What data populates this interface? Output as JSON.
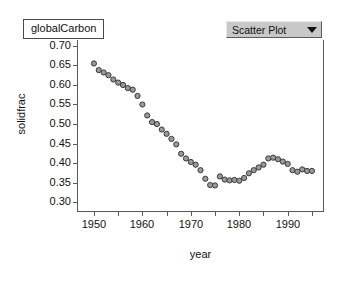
{
  "title": {
    "text": "globalCarbon"
  },
  "plot_type_selector": {
    "value": "Scatter Plot",
    "caret_icon": "chevron-down-icon"
  },
  "colors": {
    "marker_fill": "#9a9a9a",
    "marker_stroke": "#3a3a3a",
    "axis": "#5a5a5a",
    "text": "#111111",
    "dropdown_face": "#c8c8c8",
    "background": "#ffffff"
  },
  "chart_data": {
    "type": "scatter",
    "title": "globalCarbon",
    "xlabel": "year",
    "ylabel": "solidfrac",
    "xlim": [
      1946.5,
      1997.5
    ],
    "ylim": [
      0.275,
      0.715
    ],
    "grid": false,
    "legend": null,
    "xticks": [
      1950,
      1960,
      1970,
      1980,
      1990
    ],
    "xticks_minor": [
      1955,
      1965,
      1975,
      1985,
      1995
    ],
    "yticks": [
      0.3,
      0.35,
      0.4,
      0.45,
      0.5,
      0.55,
      0.6,
      0.65,
      0.7
    ],
    "ytick_labels": [
      "0.30",
      "0.35",
      "0.40",
      "0.45",
      "0.50",
      "0.55",
      "0.60",
      "0.65",
      "0.70"
    ],
    "xtick_labels": [
      "1950",
      "1960",
      "1970",
      "1980",
      "1990"
    ],
    "x": [
      1950,
      1951,
      1952,
      1953,
      1954,
      1955,
      1956,
      1957,
      1958,
      1959,
      1960,
      1961,
      1962,
      1963,
      1964,
      1965,
      1966,
      1967,
      1968,
      1969,
      1970,
      1971,
      1972,
      1973,
      1974,
      1975,
      1976,
      1977,
      1978,
      1979,
      1980,
      1981,
      1982,
      1983,
      1984,
      1985,
      1986,
      1987,
      1988,
      1989,
      1990,
      1991,
      1992,
      1993,
      1994,
      1995
    ],
    "y": [
      0.655,
      0.638,
      0.632,
      0.625,
      0.614,
      0.606,
      0.6,
      0.592,
      0.588,
      0.572,
      0.55,
      0.522,
      0.505,
      0.5,
      0.486,
      0.475,
      0.462,
      0.448,
      0.424,
      0.412,
      0.403,
      0.396,
      0.382,
      0.36,
      0.344,
      0.343,
      0.366,
      0.358,
      0.356,
      0.357,
      0.355,
      0.362,
      0.374,
      0.382,
      0.389,
      0.396,
      0.412,
      0.414,
      0.41,
      0.404,
      0.398,
      0.382,
      0.378,
      0.384,
      0.38,
      0.38
    ]
  }
}
